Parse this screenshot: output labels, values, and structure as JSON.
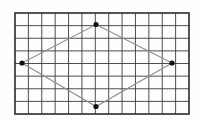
{
  "figure": {
    "canvas": {
      "width": 201,
      "height": 122,
      "background": "#fefefe"
    },
    "grid": {
      "x": 15,
      "y": 13,
      "width": 174,
      "height": 101,
      "cols": 13,
      "rows": 8,
      "line_color": "#3a3a3a",
      "line_width": 0.9,
      "border_color": "#2b2b2b",
      "border_width": 1.6
    },
    "rhombus": {
      "stroke_color": "#8f8f8f",
      "stroke_width": 1.1,
      "vertices": [
        {
          "name": "top",
          "x": 96,
          "y": 24.5
        },
        {
          "name": "right",
          "x": 172,
          "y": 63
        },
        {
          "name": "bottom",
          "x": 96,
          "y": 106.5
        },
        {
          "name": "left",
          "x": 22,
          "y": 63
        }
      ],
      "dot_color": "#101010",
      "dot_radius": 2.6
    }
  }
}
